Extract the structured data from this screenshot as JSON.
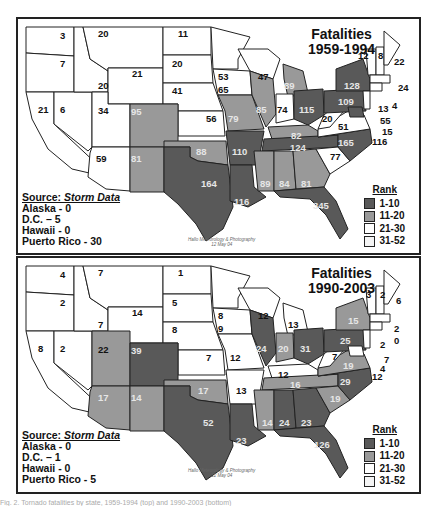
{
  "colors": {
    "rank_1_10": "#595959",
    "rank_11_20": "#999999",
    "rank_21_30": "#ffffff",
    "rank_31_52": "#f4f4f4",
    "border": "#222222"
  },
  "legend": {
    "title": "Rank",
    "items": [
      {
        "label": "1-10",
        "color": "#595959"
      },
      {
        "label": "11-20",
        "color": "#999999"
      },
      {
        "label": "21-30",
        "color": "#ffffff"
      },
      {
        "label": "31-52",
        "color": "#f4f4f4"
      }
    ]
  },
  "maps": [
    {
      "title_line1": "Fatalities",
      "title_line2": "1959-1994",
      "source_heading": "Source: ",
      "source_name": "Storm Data",
      "notes": [
        "Alaska - 0",
        "D.C. – 5",
        "Hawaii - 0",
        "Puerto Rico - 30"
      ],
      "credit_line1": "Hallo Meteorology & Photography",
      "credit_line2": "12 May 04",
      "states": {
        "WA": "3",
        "OR": "7",
        "CA": "21",
        "NV": "6",
        "ID": "20",
        "MT": "20",
        "WY": "21",
        "UT": "34",
        "AZ": "59",
        "CO": "95",
        "NM": "81",
        "ND": "11",
        "SD": "20",
        "NE": "41",
        "KS": "56",
        "OK": "88",
        "TX": "164",
        "MN": "53",
        "IA": "65",
        "MO": "79",
        "AR": "110",
        "LA": "116",
        "WI": "47",
        "IL": "85",
        "MI": "89",
        "IN": "74",
        "OH": "115",
        "KY": "82",
        "TN": "124",
        "MS": "89",
        "AL": "84",
        "GA": "81",
        "FL": "345",
        "SC": "77",
        "NC": "165",
        "VA": "51",
        "WV": "20",
        "PA": "109",
        "NY": "128",
        "VT": "12",
        "NH": "8",
        "ME": "22",
        "MA": "24",
        "RI": "4",
        "CT": "13",
        "NJ": "55",
        "DE": "15",
        "MD": "116"
      }
    },
    {
      "title_line1": "Fatalities",
      "title_line2": "1990-2003",
      "source_heading": "Source: ",
      "source_name": "Storm Data",
      "notes": [
        "Alaska - 0",
        "D.C. – 1",
        "Hawaii - 0",
        "Puerto Rico - 5"
      ],
      "credit_line1": "Hallo Meteorology & Photography",
      "credit_line2": "12 May 04",
      "states": {
        "WA": "4",
        "OR": "2",
        "CA": "8",
        "NV": "2",
        "ID": "7",
        "MT": "7",
        "WY": "14",
        "UT": "22",
        "AZ": "17",
        "CO": "39",
        "NM": "14",
        "ND": "1",
        "SD": "5",
        "NE": "8",
        "KS": "7",
        "OK": "17",
        "TX": "52",
        "MN": "8",
        "IA": "9",
        "MO": "12",
        "AR": "13",
        "LA": "23",
        "WI": "12",
        "IL": "24",
        "MI": "13",
        "IN": "20",
        "OH": "31",
        "KY": "12",
        "TN": "16",
        "MS": "14",
        "AL": "24",
        "GA": "23",
        "FL": "126",
        "SC": "19",
        "NC": "29",
        "VA": "19",
        "WV": "7",
        "PA": "25",
        "NY": "15",
        "VT": "3",
        "NH": "2",
        "ME": "6",
        "MA": "2",
        "RI": "0",
        "CT": "2",
        "NJ": "7",
        "DE": "4",
        "MD": "12"
      }
    }
  ],
  "caption": "Fig. 2. Tornado fatalities by state, 1959-1994 (top) and 1990-2003 (bottom)"
}
